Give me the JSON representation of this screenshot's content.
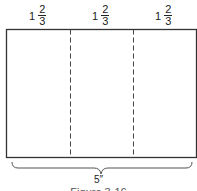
{
  "figure": {
    "segments": [
      {
        "whole": "1",
        "numerator": "2",
        "denominator": "3"
      },
      {
        "whole": "1",
        "numerator": "2",
        "denominator": "3"
      },
      {
        "whole": "1",
        "numerator": "2",
        "denominator": "3"
      }
    ],
    "total_width_label": "5″",
    "caption": "Figure 3-16"
  }
}
